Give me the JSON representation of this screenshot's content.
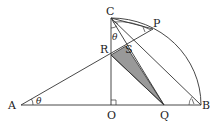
{
  "diagram": {
    "points": {
      "A": {
        "label": "A",
        "x": 21,
        "y": 105
      },
      "O": {
        "label": "O",
        "x": 111,
        "y": 105
      },
      "Q": {
        "label": "Q",
        "x": 164,
        "y": 105
      },
      "B": {
        "label": "B",
        "x": 201,
        "y": 105
      },
      "C": {
        "label": "C",
        "x": 111,
        "y": 18
      },
      "R": {
        "label": "R",
        "x": 111,
        "y": 55
      },
      "S": {
        "label": "S",
        "x": 126,
        "y": 46
      },
      "P": {
        "label": "P",
        "x": 153,
        "y": 29
      }
    },
    "angle_labels": {
      "at_A": "θ",
      "at_C": "θ"
    },
    "shaded_triangle": [
      "R",
      "S",
      "Q"
    ],
    "colors": {
      "line": "#333333",
      "shade": "#999999"
    }
  }
}
